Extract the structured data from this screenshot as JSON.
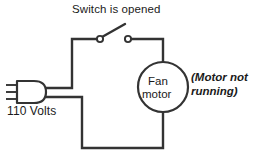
{
  "figure": {
    "title": "Switch is opened",
    "source_label": "110 Volts",
    "load": {
      "line1": "Fan",
      "line2": "motor"
    },
    "annotation": {
      "line1": "(Motor not",
      "line2": "running)"
    },
    "colors": {
      "background": "#ffffff",
      "ink": "#1a1a1a",
      "wire": "#333333"
    },
    "geometry": {
      "wire_width": 2.4,
      "motor_center_x": 163,
      "motor_center_y": 87,
      "motor_radius": 25,
      "switch_terminal_left_x": 100,
      "switch_terminal_right_x": 127,
      "switch_terminal_y": 39,
      "switch_state": "open"
    }
  }
}
